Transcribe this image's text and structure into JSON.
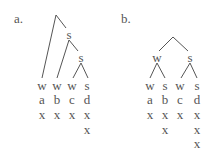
{
  "trees": [
    {
      "label": "a.",
      "label_pos": [
        14,
        12
      ],
      "nodes": [
        {
          "text": "",
          "x": 56,
          "y": 15
        },
        {
          "text": "s",
          "x": 69,
          "y": 34
        },
        {
          "text": "s",
          "x": 81,
          "y": 57
        }
      ],
      "edges": [
        [
          56,
          15,
          42,
          78
        ],
        [
          56,
          15,
          66,
          28
        ],
        [
          69,
          40,
          57,
          78
        ],
        [
          69,
          40,
          78,
          51
        ],
        [
          81,
          63,
          73,
          78
        ],
        [
          81,
          63,
          88,
          78
        ]
      ],
      "columns": [
        {
          "x": 42,
          "rows": [
            "w",
            "a",
            "x"
          ]
        },
        {
          "x": 57,
          "rows": [
            "w",
            "b",
            "x"
          ]
        },
        {
          "x": 72,
          "rows": [
            "w",
            "c",
            "x"
          ]
        },
        {
          "x": 87,
          "rows": [
            "s",
            "d",
            "x",
            "x"
          ]
        }
      ]
    },
    {
      "label": "b.",
      "label_pos": [
        121,
        12
      ],
      "nodes": [
        {
          "text": "",
          "x": 173,
          "y": 37
        },
        {
          "text": "w",
          "x": 157,
          "y": 57
        },
        {
          "text": "s",
          "x": 190,
          "y": 57
        }
      ],
      "edges": [
        [
          173,
          37,
          159,
          51
        ],
        [
          173,
          37,
          188,
          51
        ],
        [
          157,
          63,
          150,
          78
        ],
        [
          157,
          63,
          165,
          78
        ],
        [
          190,
          63,
          181,
          78
        ],
        [
          190,
          63,
          197,
          78
        ]
      ],
      "columns": [
        {
          "x": 150,
          "rows": [
            "w",
            "a",
            "x"
          ]
        },
        {
          "x": 165,
          "rows": [
            "s",
            "b",
            "x",
            "x"
          ]
        },
        {
          "x": 180,
          "rows": [
            "w",
            "c",
            "x"
          ]
        },
        {
          "x": 197,
          "rows": [
            "s",
            "d",
            "x",
            "x",
            "x"
          ]
        }
      ]
    }
  ],
  "row_y": [
    85,
    99,
    114,
    129,
    143
  ],
  "line_color": "#555555"
}
